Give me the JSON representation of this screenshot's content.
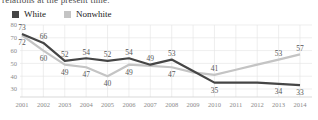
{
  "caption_fragment": "relations at the present time.",
  "legend": {
    "items": [
      {
        "label": "White"
      },
      {
        "label": "Nonwhite"
      }
    ]
  },
  "colors": {
    "white_series": "#454545",
    "nonwhite_series": "#c4c4c4",
    "grid": "#e2e2e2",
    "axis_line": "#cfcfcf",
    "axis_text": "#8a8a8a",
    "value_text": "#555555",
    "legend_text": "#222222",
    "background": "#ffffff"
  },
  "chart_data": {
    "type": "line",
    "title": "",
    "xlabel": "",
    "ylabel": "",
    "categories": [
      "2001",
      "2002",
      "2003",
      "2004",
      "2005",
      "2006",
      "2007",
      "2008",
      "2009",
      "2010",
      "2011",
      "2012",
      "2013",
      "2014"
    ],
    "yticks": [
      30,
      40,
      50,
      60,
      70,
      80
    ],
    "ylim": [
      24,
      80
    ],
    "grid": true,
    "legend_position": "top-left",
    "series": [
      {
        "name": "White",
        "values": [
          73,
          66,
          52,
          54,
          52,
          54,
          49,
          53,
          44,
          35,
          35,
          35,
          34,
          33
        ],
        "point_labels": [
          73,
          66,
          52,
          54,
          52,
          54,
          49,
          53,
          null,
          35,
          null,
          null,
          34,
          33
        ]
      },
      {
        "name": "Nonwhite",
        "values": [
          72,
          60,
          49,
          47,
          40,
          49,
          48,
          47,
          43,
          41,
          45,
          49,
          53,
          57
        ],
        "point_labels": [
          72,
          60,
          49,
          47,
          40,
          49,
          null,
          47,
          null,
          41,
          null,
          null,
          53,
          57
        ]
      }
    ]
  }
}
